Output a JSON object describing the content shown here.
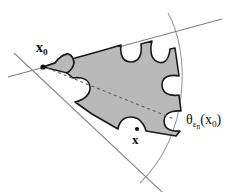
{
  "figure": {
    "background_color": "#ffffff",
    "labels": {
      "vertex_point": {
        "name": "x0-label",
        "base": "x",
        "sub": "0",
        "x": 36,
        "y": 41
      },
      "boundary_point": {
        "name": "x-label",
        "base": "x",
        "x": 132,
        "y": 133
      },
      "cone_label": {
        "name": "theta-epsilon-n-x0-label",
        "base": "θ",
        "sub": "ε",
        "subsub": "n",
        "paren_open": "(",
        "arg_base": "x",
        "arg_sub": "0",
        "paren_close": ")",
        "x": 186,
        "y": 113
      }
    },
    "colors": {
      "region_fill": "#b9b9b9",
      "region_outline": "#1a1a1a",
      "cone_line": "#808080",
      "arc_line": "#9a9a9a",
      "dashed_axis": "#6f6f6f",
      "point_marker": "#101010",
      "text": "#111111"
    },
    "geometry": {
      "cone_vertex": [
        43,
        67
      ],
      "cone_upper_ray_end": [
        222,
        19
      ],
      "cone_lower_ray_end": [
        160,
        192
      ],
      "cone_back_upper": [
        8,
        77
      ],
      "cone_back_lower": [
        8,
        52
      ],
      "outer_arc_start": [
        168,
        13
      ],
      "outer_arc_end": [
        140,
        183
      ],
      "dashed_axis_start": [
        47,
        68
      ],
      "dashed_axis_end": [
        172,
        118
      ],
      "boundary_point_marker": [
        137,
        129
      ]
    }
  }
}
